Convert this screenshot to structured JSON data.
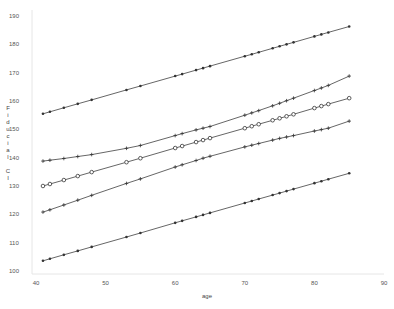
{
  "chart_data": {
    "type": "line",
    "title": "",
    "xlabel": "age",
    "ylabel": "Fiducial CI",
    "xlim": [
      40,
      90
    ],
    "ylim": [
      100,
      190
    ],
    "xticks": [
      40,
      50,
      60,
      70,
      80,
      90
    ],
    "yticks": [
      100,
      110,
      120,
      130,
      140,
      150,
      160,
      170,
      180,
      190
    ],
    "grid": false,
    "legend": null,
    "x": [
      41,
      42,
      44,
      46,
      48,
      53,
      55,
      60,
      61,
      63,
      64,
      65,
      70,
      71,
      72,
      74,
      75,
      76,
      77,
      80,
      81,
      82,
      85
    ],
    "series": [
      {
        "name": "upper bound (outer)",
        "marker": "dot",
        "values": [
          155.5,
          156.2,
          157.6,
          159.0,
          160.4,
          163.9,
          165.3,
          168.8,
          169.5,
          170.9,
          171.6,
          172.3,
          175.8,
          176.5,
          177.2,
          178.6,
          179.3,
          180.0,
          180.7,
          182.8,
          183.5,
          184.2,
          186.3
        ]
      },
      {
        "name": "upper bound (inner)",
        "marker": "plus",
        "values": [
          138.8,
          139.1,
          139.7,
          140.4,
          141.1,
          143.3,
          144.3,
          147.8,
          148.5,
          149.8,
          150.4,
          151.0,
          155.0,
          155.8,
          156.6,
          158.3,
          159.2,
          160.1,
          161.0,
          163.7,
          164.6,
          165.5,
          168.8
        ]
      },
      {
        "name": "estimate",
        "marker": "circle",
        "values": [
          130.0,
          130.7,
          132.1,
          133.5,
          134.9,
          138.4,
          139.8,
          143.4,
          144.1,
          145.5,
          146.2,
          146.9,
          150.4,
          151.1,
          151.8,
          153.2,
          153.9,
          154.6,
          155.3,
          157.5,
          158.2,
          158.9,
          161.0
        ]
      },
      {
        "name": "lower bound (inner)",
        "marker": "plus",
        "values": [
          120.8,
          121.6,
          123.3,
          125.0,
          126.7,
          130.9,
          132.5,
          136.7,
          137.5,
          139.0,
          139.8,
          140.5,
          143.8,
          144.4,
          145.0,
          146.2,
          146.8,
          147.3,
          147.8,
          149.4,
          149.9,
          150.4,
          152.9
        ]
      },
      {
        "name": "lower bound (outer)",
        "marker": "dot",
        "values": [
          103.6,
          104.3,
          105.7,
          107.1,
          108.5,
          112.0,
          113.4,
          117.0,
          117.7,
          119.1,
          119.8,
          120.5,
          124.0,
          124.7,
          125.4,
          126.8,
          127.5,
          128.2,
          128.9,
          131.0,
          131.7,
          132.4,
          134.5
        ]
      }
    ]
  },
  "labels": {
    "xlabel": "age",
    "ylabel_letters": [
      "F",
      "i",
      "d",
      "u",
      "c",
      "i",
      "a",
      "l",
      "",
      "C",
      "I"
    ]
  },
  "colors": {
    "line": "#555555",
    "marker": "#333333",
    "axis": "#e6e6e6",
    "text": "#555555"
  }
}
